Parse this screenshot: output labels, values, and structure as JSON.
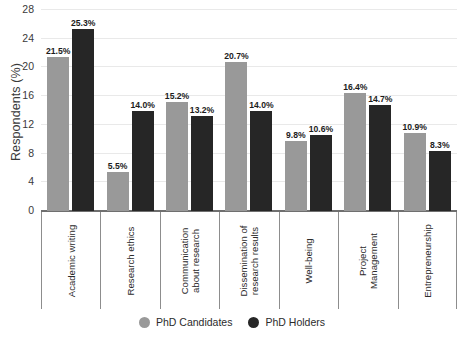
{
  "chart_data": {
    "type": "bar",
    "title": "",
    "subtitle": "",
    "xlabel": "",
    "ylabel": "Respondents (%)",
    "ylim": [
      0,
      28
    ],
    "yticks": [
      0,
      4,
      8,
      12,
      16,
      20,
      24,
      28
    ],
    "grid": true,
    "legend_position": "bottom",
    "value_suffix": "%",
    "categories": [
      "Academic writing",
      "Research ethics",
      "Communication\nabout research",
      "Dissemination of\nresearch results",
      "Well-being",
      "Project\nManagement",
      "Entrepreneurship"
    ],
    "series": [
      {
        "name": "PhD Candidates",
        "color": "#999999",
        "values": [
          21.5,
          5.5,
          15.2,
          20.7,
          9.8,
          16.4,
          10.9
        ],
        "labels": [
          "21.5%",
          "5.5%",
          "15.2%",
          "20.7%",
          "9.8%",
          "16.4%",
          "10.9%"
        ]
      },
      {
        "name": "PhD Holders",
        "color": "#262626",
        "values": [
          25.3,
          14.0,
          13.2,
          14.0,
          10.6,
          14.7,
          8.3
        ],
        "labels": [
          "25.3%",
          "14.0%",
          "13.2%",
          "14.0%",
          "10.6%",
          "14.7%",
          "8.3%"
        ]
      }
    ]
  }
}
